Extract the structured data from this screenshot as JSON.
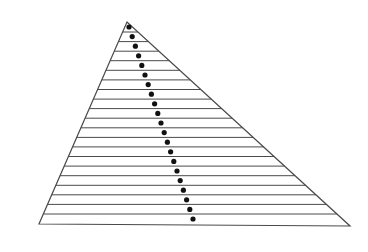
{
  "figure": {
    "type": "triangle-with-hatch-lines-and-dotted-path",
    "width": 368,
    "height": 252,
    "background": "#ffffff",
    "stroke_color": "#4a4a4a",
    "dot_color": "#111111",
    "triangle": {
      "apex": [
        127,
        22
      ],
      "bottom_left": [
        39,
        224
      ],
      "bottom_right": [
        350,
        226
      ]
    },
    "hatch_lines": {
      "count": 20,
      "y_start": 32,
      "y_end": 214,
      "direction": "horizontal"
    },
    "dotted_path": {
      "start": [
        129,
        27
      ],
      "end": [
        193,
        219
      ],
      "dot_count": 21,
      "dot_radius": 2.6
    }
  }
}
